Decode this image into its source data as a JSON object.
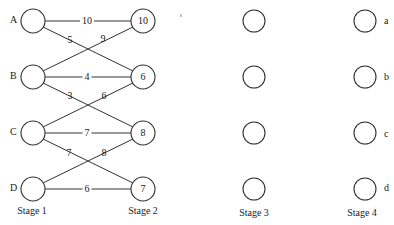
{
  "stages": [
    {
      "label": "Stage 1"
    },
    {
      "label": "Stage 2"
    },
    {
      "label": "Stage 3"
    },
    {
      "label": "Stage 4"
    }
  ],
  "stage1_nodes": [
    "A",
    "B",
    "C",
    "D"
  ],
  "stage2_values": [
    "10",
    "6",
    "8",
    "7"
  ],
  "stage4_labels": [
    "a",
    "b",
    "c",
    "d"
  ],
  "edges": {
    "A_10": "10",
    "A_6": "5",
    "B_10": "9",
    "B_6": "4",
    "B_8": "3",
    "C_6": "6",
    "C_8": "7",
    "C_7": "7",
    "D_8": "8",
    "D_7": "6"
  },
  "colors": {
    "line": "#333333",
    "text": "#1a1a1a",
    "background": "#ffffff"
  }
}
